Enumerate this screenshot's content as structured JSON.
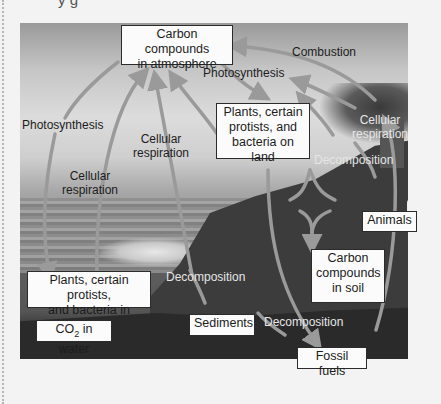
{
  "page": {
    "top_text_fragment": "y g"
  },
  "boxes": {
    "atmosphere": "Carbon compounds in atmosphere",
    "atmosphere_l1": "Carbon compounds",
    "atmosphere_l2": "in atmosphere",
    "land_plants_l1": "Plants, certain",
    "land_plants_l2": "protists, and",
    "land_plants_l3": "bacteria on land",
    "animals": "Animals",
    "soil_l1": "Carbon",
    "soil_l2": "compounds",
    "soil_l3": "in soil",
    "water_plants_l1": "Plants, certain protists,",
    "water_plants_l2": "and bacteria in water",
    "co2_water_prefix": "CO",
    "co2_water_sub": "2",
    "co2_water_suffix": " in water",
    "sediments": "Sediments",
    "fossil_fuels": "Fossil fuels"
  },
  "labels": {
    "combustion": "Combustion",
    "photosynthesis_top": "Photosynthesis",
    "photosynthesis_left": "Photosynthesis",
    "cellular_resp_right_l1": "Cellular",
    "cellular_resp_right_l2": "respiration",
    "cellular_resp_mid_l1": "Cellular",
    "cellular_resp_mid_l2": "respiration",
    "cellular_resp_left_l1": "Cellular",
    "cellular_resp_left_l2": "respiration",
    "decomposition_land": "Decomposition",
    "decomposition_water": "Decomposition",
    "decomposition_fossil": "Decomposition"
  },
  "colors": {
    "arrow": "#9a9a9a",
    "box_fill": "#fbfbfb",
    "box_border": "#2b2b2b"
  }
}
